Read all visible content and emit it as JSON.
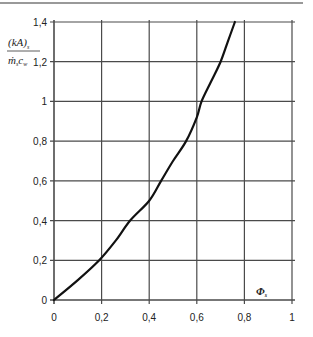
{
  "chart_data": {
    "type": "line",
    "title": "",
    "xlabel": "Φs",
    "ylabel": {
      "numerator": "(kA)s",
      "denominator": "ṁs cw"
    },
    "xlim": [
      0,
      1
    ],
    "ylim": [
      0,
      1.4
    ],
    "grid": true,
    "legend": null,
    "x_ticks": [
      "0",
      "0,2",
      "0,4",
      "0,6",
      "0,8",
      "1"
    ],
    "y_ticks": [
      "0",
      "0,2",
      "0,4",
      "0,6",
      "0,8",
      "1",
      "1,2",
      "1,4"
    ],
    "series": [
      {
        "name": "curve",
        "x": [
          0,
          0.1,
          0.19,
          0.26,
          0.32,
          0.4,
          0.45,
          0.5,
          0.555,
          0.6,
          0.62,
          0.66,
          0.7,
          0.73,
          0.76
        ],
        "y": [
          0,
          0.1,
          0.2,
          0.3,
          0.4,
          0.5,
          0.6,
          0.7,
          0.8,
          0.92,
          1.0,
          1.1,
          1.2,
          1.3,
          1.4
        ]
      }
    ]
  },
  "labels": {
    "x_axis_symbol": "Φ",
    "x_axis_sub": "s",
    "y_num_main": "(kA)",
    "y_num_sub": "s",
    "y_den_m": "ṁ",
    "y_den_m_sub": "s",
    "y_den_c": "c",
    "y_den_c_sub": "w"
  },
  "colors": {
    "grid": "#4a4a4a",
    "curve": "#111111",
    "rule": "#666666"
  }
}
